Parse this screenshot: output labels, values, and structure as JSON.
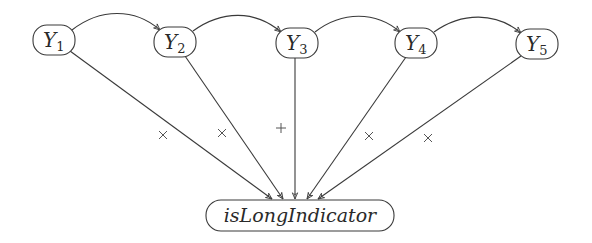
{
  "diagram": {
    "nodes": [
      {
        "id": "Y1",
        "base": "Y",
        "sub": "1",
        "cx": 54,
        "cy": 40
      },
      {
        "id": "Y2",
        "base": "Y",
        "sub": "2",
        "cx": 175,
        "cy": 42
      },
      {
        "id": "Y3",
        "base": "Y",
        "sub": "3",
        "cx": 297,
        "cy": 43
      },
      {
        "id": "Y4",
        "base": "Y",
        "sub": "4",
        "cx": 416,
        "cy": 43
      },
      {
        "id": "Y5",
        "base": "Y",
        "sub": "5",
        "cx": 537,
        "cy": 44
      }
    ],
    "target": {
      "id": "isLongIndicator",
      "label": "isLongIndicator",
      "cx": 300,
      "cy": 216
    },
    "sequence_edges": [
      {
        "from": "Y1",
        "to": "Y2"
      },
      {
        "from": "Y2",
        "to": "Y3"
      },
      {
        "from": "Y3",
        "to": "Y4"
      },
      {
        "from": "Y4",
        "to": "Y5"
      }
    ],
    "influence_edges": [
      {
        "from": "Y1",
        "to": "isLongIndicator",
        "sign": "×"
      },
      {
        "from": "Y2",
        "to": "isLongIndicator",
        "sign": "×"
      },
      {
        "from": "Y3",
        "to": "isLongIndicator",
        "sign": "+"
      },
      {
        "from": "Y4",
        "to": "isLongIndicator",
        "sign": "×"
      },
      {
        "from": "Y5",
        "to": "isLongIndicator",
        "sign": "×"
      }
    ],
    "colors": {
      "stroke": "#3a3a3a",
      "text": "#2a2a2a",
      "background": "#ffffff"
    }
  }
}
